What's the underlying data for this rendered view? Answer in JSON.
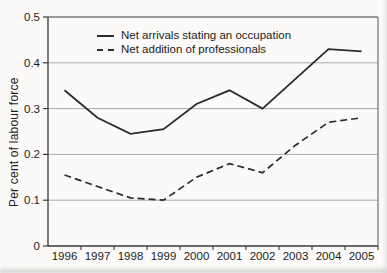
{
  "figure": {
    "background": "#fbfaf8",
    "axis_color": "#3a3a3a",
    "border_color": "#555555",
    "grid_color": "#aaaaaa",
    "line_color": "#2b2b2b",
    "text_color": "#1c1c1c"
  },
  "chart_data": {
    "type": "line",
    "title": "",
    "xlabel": "",
    "ylabel": "Per cent of labour force",
    "categories": [
      "1996",
      "1997",
      "1998",
      "1999",
      "2000",
      "2001",
      "2002",
      "2003",
      "2004",
      "2005"
    ],
    "series": [
      {
        "name": "Net arrivals stating an occupation",
        "style": "solid",
        "values": [
          0.34,
          0.28,
          0.245,
          0.255,
          0.31,
          0.34,
          0.3,
          0.365,
          0.43,
          0.425
        ]
      },
      {
        "name": "Net addition of professionals",
        "style": "dashed",
        "values": [
          0.155,
          0.13,
          0.105,
          0.1,
          0.15,
          0.18,
          0.16,
          0.22,
          0.27,
          0.28
        ]
      }
    ],
    "ylim": [
      0,
      0.5
    ],
    "yticks": [
      0,
      0.1,
      0.2,
      0.3,
      0.4,
      0.5
    ],
    "ytick_labels": [
      "0",
      "0.1",
      "0.2",
      "0.3",
      "0.4",
      "0.5"
    ],
    "grid": "horizontal",
    "legend_position": "top-left-inside"
  }
}
